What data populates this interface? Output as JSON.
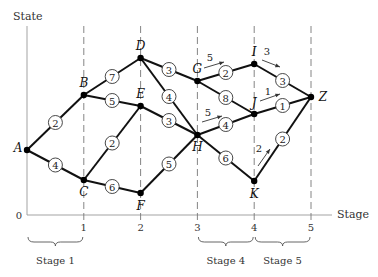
{
  "axes": {
    "y_label": "State",
    "x_label": "Stage",
    "origin_label": "0",
    "x_ticks": [
      "1",
      "2",
      "3",
      "4",
      "5"
    ]
  },
  "stages": [
    {
      "label": "Stage 1",
      "from": 0,
      "to": 1
    },
    {
      "label": "Stage 4",
      "from": 3,
      "to": 4
    },
    {
      "label": "Stage 5",
      "from": 4,
      "to": 5
    }
  ],
  "nodes": [
    {
      "id": "A",
      "stage": 0
    },
    {
      "id": "B",
      "stage": 1
    },
    {
      "id": "C",
      "stage": 1
    },
    {
      "id": "D",
      "stage": 2
    },
    {
      "id": "E",
      "stage": 2
    },
    {
      "id": "F",
      "stage": 2
    },
    {
      "id": "G",
      "stage": 3
    },
    {
      "id": "H",
      "stage": 3
    },
    {
      "id": "I",
      "stage": 4
    },
    {
      "id": "J",
      "stage": 4
    },
    {
      "id": "K",
      "stage": 4
    },
    {
      "id": "Z",
      "stage": 5
    }
  ],
  "edges": [
    {
      "from": "A",
      "to": "B",
      "weight": "2"
    },
    {
      "from": "A",
      "to": "C",
      "weight": "4"
    },
    {
      "from": "B",
      "to": "D",
      "weight": "7"
    },
    {
      "from": "B",
      "to": "E",
      "weight": "5"
    },
    {
      "from": "C",
      "to": "E",
      "weight": "2"
    },
    {
      "from": "C",
      "to": "F",
      "weight": "6"
    },
    {
      "from": "D",
      "to": "G",
      "weight": "3"
    },
    {
      "from": "D",
      "to": "H",
      "weight": "4"
    },
    {
      "from": "E",
      "to": "H",
      "weight": "3"
    },
    {
      "from": "F",
      "to": "H",
      "weight": "5"
    },
    {
      "from": "G",
      "to": "I",
      "weight": "2"
    },
    {
      "from": "G",
      "to": "J",
      "weight": "8"
    },
    {
      "from": "H",
      "to": "J",
      "weight": "4"
    },
    {
      "from": "H",
      "to": "K",
      "weight": "6"
    },
    {
      "from": "I",
      "to": "Z",
      "weight": "3"
    },
    {
      "from": "J",
      "to": "Z",
      "weight": "1"
    },
    {
      "from": "K",
      "to": "Z",
      "weight": "2"
    }
  ],
  "cost_annotations": [
    {
      "near": "G",
      "value": "5"
    },
    {
      "near": "I",
      "value": "3"
    },
    {
      "near": "J",
      "value": "1"
    },
    {
      "near": "H",
      "value": "5"
    },
    {
      "near": "K",
      "value": "2"
    }
  ]
}
